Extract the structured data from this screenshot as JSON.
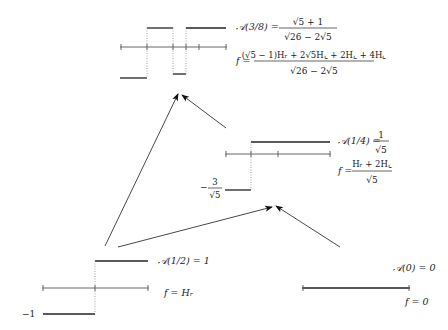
{
  "panels": {
    "top": {
      "A_label": "𝒜(3/8) =",
      "A_num": "√5 + 1",
      "A_den": "√26 − 2√5",
      "f_label": "f =",
      "f_num": "(√5 − 1)Hᵣ + 2√5H⌞ + 2H⌞ + 4H⌞",
      "f_den": "√26 − 2√5"
    },
    "middle": {
      "A_label": "𝒜(1/4) =",
      "A_num": "1",
      "A_den": "√5",
      "f_label": "f =",
      "f_num": "Hᵣ + 2H⌞",
      "f_den": "√5",
      "low_minus": "−",
      "low_num": "3",
      "low_den": "√5"
    },
    "bottom_left": {
      "A_text": "𝒜(1/2) = 1",
      "f_text": "f = Hᵣ",
      "low_label": "−1"
    },
    "bottom_right": {
      "A_text": "𝒜(0) = 0",
      "f_text": "f = 0"
    }
  }
}
